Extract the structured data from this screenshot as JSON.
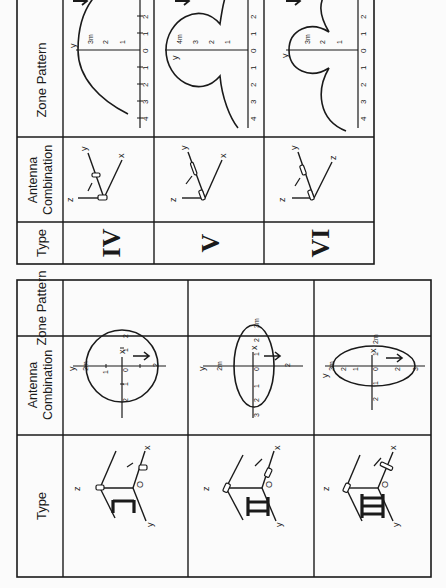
{
  "document": {
    "orientation": "rotated-90-ccw",
    "headers": {
      "type": "Type",
      "antenna_line1": "Antenna",
      "antenna_line2": "Combination",
      "zone": "Zone Pattern"
    },
    "tables": [
      {
        "id": "table-1",
        "rows": [
          {
            "type": "I",
            "antenna": {
              "labels": [
                "z",
                "O",
                "x",
                "y"
              ],
              "elements_on": [
                "z",
                "x"
              ]
            },
            "zone": {
              "shape": "circle",
              "x_ticks": [
                "2",
                "1",
                "0",
                "1",
                "2"
              ],
              "y_ticks": [
                "2",
                "1",
                "1",
                "2"
              ],
              "unit_label": "2m",
              "axis_labels": [
                "x",
                "y"
              ]
            }
          },
          {
            "type": "II",
            "antenna": {
              "labels": [
                "z",
                "O",
                "x",
                "y"
              ],
              "elements_on": [
                "z",
                "x"
              ]
            },
            "zone": {
              "shape": "ellipse-elongated-y",
              "x_ticks": [
                "3m",
                "2",
                "1",
                "0",
                "1",
                "2",
                "3"
              ],
              "y_ticks": [
                "2m",
                "1",
                "2"
              ],
              "axis_labels": [
                "x",
                "y"
              ]
            }
          },
          {
            "type": "III",
            "antenna": {
              "labels": [
                "z",
                "O",
                "x",
                "y"
              ],
              "elements_on": [
                "z",
                "x"
              ]
            },
            "zone": {
              "shape": "ellipse-elongated-x",
              "x_ticks": [
                "2m",
                "1",
                "0",
                "1",
                "2"
              ],
              "y_ticks": [
                "3m",
                "2",
                "1",
                "1",
                "2",
                "3"
              ],
              "axis_labels": [
                "x",
                "y"
              ]
            }
          }
        ]
      },
      {
        "id": "table-2",
        "rows": [
          {
            "type": "IV",
            "antenna": {
              "labels": [
                "z",
                "y",
                "x"
              ],
              "elements_on": [
                "y",
                "z"
              ]
            },
            "zone": {
              "shape": "semicircle",
              "axis_ticks": [
                "4",
                "3",
                "2",
                "1",
                "0",
                "1",
                "2",
                "3"
              ],
              "y_ticks": [
                "3m",
                "2",
                "1"
              ],
              "axis_labels": [
                "y"
              ]
            }
          },
          {
            "type": "V",
            "antenna": {
              "labels": [
                "z",
                "y",
                "x"
              ],
              "elements_on": [
                "y",
                "z"
              ]
            },
            "zone": {
              "shape": "keyhole-lobe",
              "axis_ticks": [
                "4",
                "3",
                "2",
                "1",
                "0",
                "1",
                "2",
                "3"
              ],
              "y_ticks": [
                "4m",
                "3",
                "2",
                "1"
              ],
              "axis_labels": [
                "y"
              ]
            }
          },
          {
            "type": "VI",
            "antenna": {
              "labels": [
                "z",
                "y",
                "z"
              ],
              "elements_on": [
                "y",
                "z"
              ]
            },
            "zone": {
              "shape": "three-lobe",
              "axis_ticks": [
                "4",
                "3",
                "2",
                "1",
                "0",
                "1",
                "2",
                "3"
              ],
              "y_ticks": [
                "3m",
                "2",
                "1"
              ],
              "axis_labels": [
                "y"
              ]
            }
          }
        ]
      }
    ]
  }
}
